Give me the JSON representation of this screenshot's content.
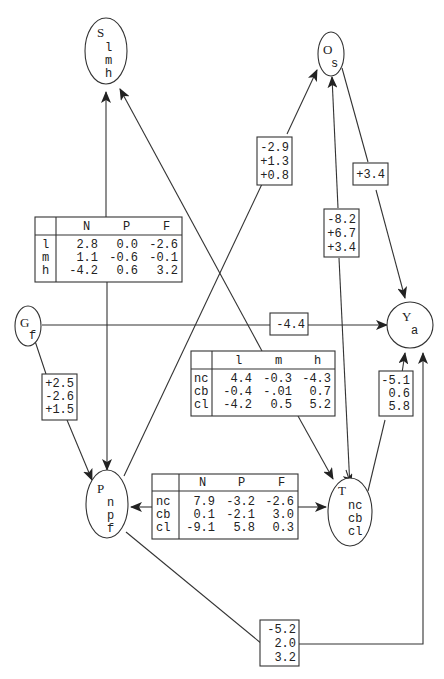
{
  "nodes": {
    "S": {
      "title": "S",
      "states": [
        "l",
        "m",
        "h"
      ]
    },
    "O": {
      "title": "O",
      "states": [
        "s"
      ]
    },
    "G": {
      "title": "G",
      "states": [
        "f"
      ]
    },
    "Y": {
      "title": "Y",
      "states": [
        "a"
      ]
    },
    "P": {
      "title": "P",
      "states": [
        "n",
        "p",
        "f"
      ]
    },
    "T": {
      "title": "T",
      "states": [
        "nc",
        "cb",
        "cl"
      ]
    }
  },
  "tables": {
    "S_P": {
      "cols": [
        "N",
        "P",
        "F"
      ],
      "rows": [
        {
          "label": "l",
          "values": [
            "2.8",
            "0.0",
            "-2.6"
          ]
        },
        {
          "label": "m",
          "values": [
            "1.1",
            "-0.6",
            "-0.1"
          ]
        },
        {
          "label": "h",
          "values": [
            "-4.2",
            "0.6",
            "3.2"
          ]
        }
      ]
    },
    "T_S": {
      "cols": [
        "l",
        "m",
        "h"
      ],
      "rows": [
        {
          "label": "nc",
          "values": [
            "4.4",
            "-0.3",
            "-4.3"
          ]
        },
        {
          "label": "cb",
          "values": [
            "-0.4",
            "-.01",
            "0.7"
          ]
        },
        {
          "label": "cl",
          "values": [
            "-4.2",
            "0.5",
            "5.2"
          ]
        }
      ]
    },
    "T_P": {
      "cols": [
        "N",
        "P",
        "F"
      ],
      "rows": [
        {
          "label": "nc",
          "values": [
            "7.9",
            "-3.2",
            "-2.6"
          ]
        },
        {
          "label": "cb",
          "values": [
            "0.1",
            "-2.1",
            "3.0"
          ]
        },
        {
          "label": "cl",
          "values": [
            "-9.1",
            "5.8",
            "0.3"
          ]
        }
      ]
    }
  },
  "boxes": {
    "P_O": [
      "-2.9",
      "+1.3",
      "+0.8"
    ],
    "O_Y": [
      "+3.4"
    ],
    "T_O": [
      "-8.2",
      "+6.7",
      "+3.4"
    ],
    "G_Y": [
      "-4.4"
    ],
    "G_P": [
      "+2.5",
      "-2.6",
      "+1.5"
    ],
    "T_Y": [
      "-5.1",
      "0.6",
      "5.8"
    ],
    "P_Y": [
      "-5.2",
      "2.0",
      "3.2"
    ]
  }
}
